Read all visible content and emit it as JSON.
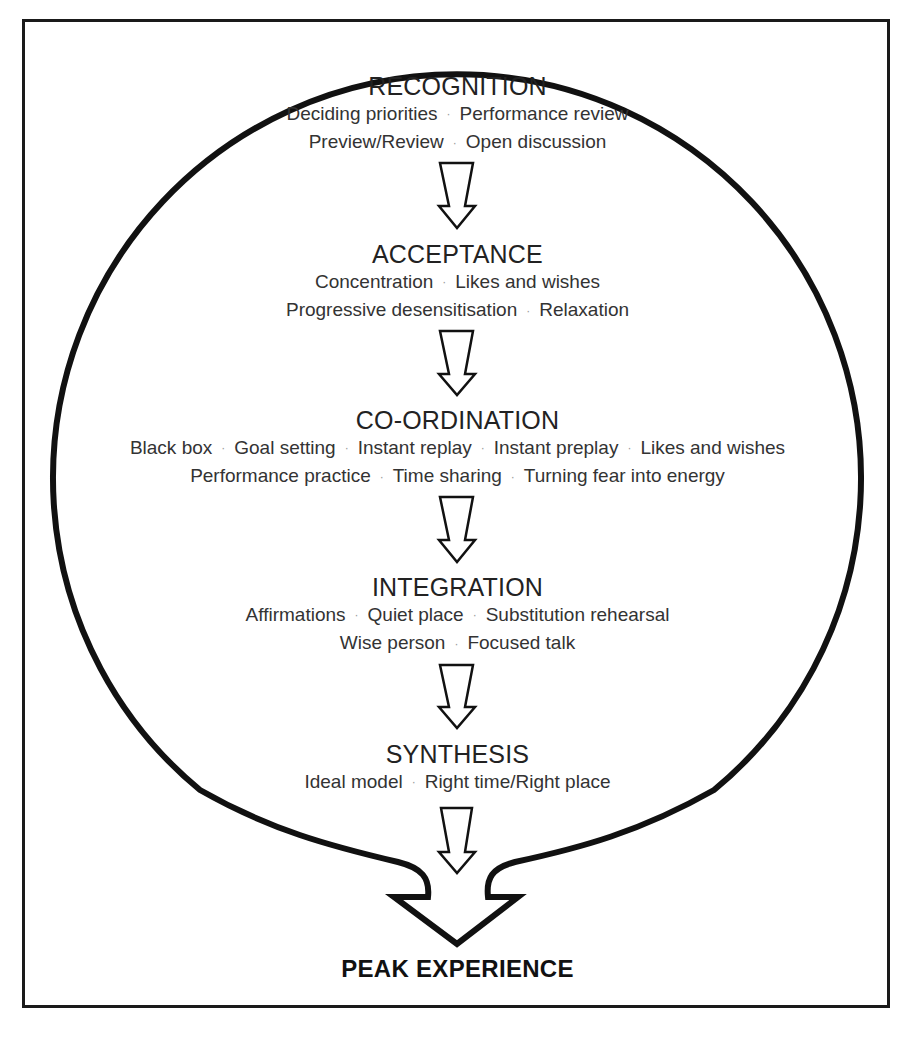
{
  "diagram": {
    "type": "flow",
    "stages": [
      {
        "title": "RECOGNITION",
        "lines": [
          [
            "Deciding priorities",
            "Performance review"
          ],
          [
            "Preview/Review",
            "Open discussion"
          ]
        ]
      },
      {
        "title": "ACCEPTANCE",
        "lines": [
          [
            "Concentration",
            "Likes and wishes"
          ],
          [
            "Progressive desensitisation",
            "Relaxation"
          ]
        ]
      },
      {
        "title": "CO-ORDINATION",
        "lines": [
          [
            "Black box",
            "Goal setting",
            "Instant replay",
            "Instant preplay",
            "Likes and wishes"
          ],
          [
            "Performance practice",
            "Time sharing",
            "Turning fear into energy"
          ]
        ]
      },
      {
        "title": "INTEGRATION",
        "lines": [
          [
            "Affirmations",
            "Quiet place",
            "Substitution rehearsal"
          ],
          [
            "Wise person",
            "Focused talk"
          ]
        ]
      },
      {
        "title": "SYNTHESIS",
        "lines": [
          [
            "Ideal model",
            "Right time/Right place"
          ]
        ]
      }
    ],
    "separator": "·",
    "outcome": "PEAK EXPERIENCE",
    "arrow_icon": "hollow-down-arrow",
    "colors": {
      "stroke": "#111111",
      "text": "#333333",
      "background": "#ffffff"
    }
  }
}
